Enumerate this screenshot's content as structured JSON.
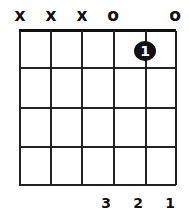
{
  "chord": {
    "strings": [
      "x",
      "x",
      "x",
      "o",
      "",
      "o"
    ],
    "dots": [
      {
        "string": 5,
        "fret": 1,
        "label": "1"
      }
    ],
    "fingers": [
      "",
      "",
      "",
      "3",
      "2",
      "1"
    ]
  }
}
